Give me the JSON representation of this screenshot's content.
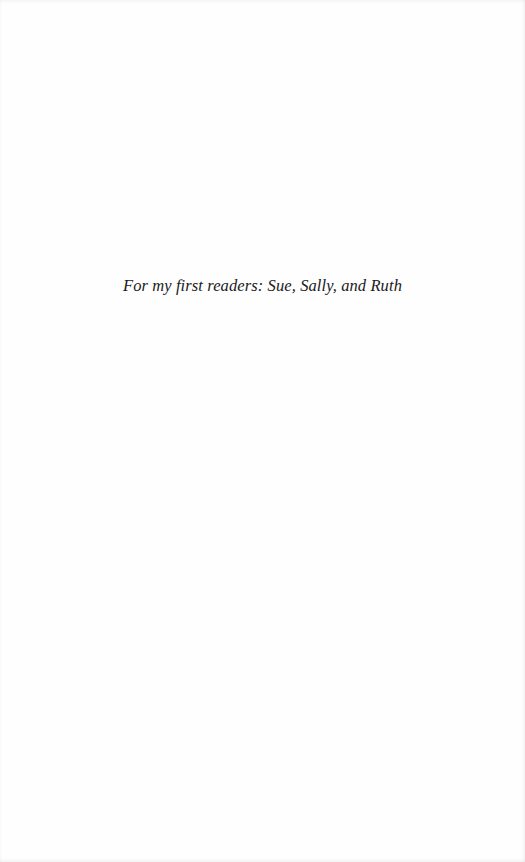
{
  "page": {
    "dedication": "For my first readers: Sue, Sally, and Ruth"
  }
}
